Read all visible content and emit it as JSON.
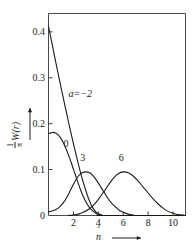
{
  "chart_data": {
    "type": "line",
    "title": "",
    "xlabel": "n̂",
    "ylabel": "(1/π) W(r)",
    "xlim": [
      0,
      11
    ],
    "ylim": [
      0,
      0.44
    ],
    "grid": false,
    "legend_position": "inline-annotations",
    "x_ticks": [
      2,
      4,
      6,
      8,
      10
    ],
    "x_tick_labels": [
      "2",
      "4",
      "6",
      "8",
      "10"
    ],
    "y_ticks": [
      0,
      0.1,
      0.2,
      0.3,
      0.4
    ],
    "y_tick_labels": [
      "0",
      "0.1",
      "0.2",
      "0.3",
      "0.4"
    ],
    "annotations": [
      {
        "text": "a=−2",
        "x": 1.6,
        "y": 0.265
      },
      {
        "text": "0",
        "x": 1.2,
        "y": 0.155
      },
      {
        "text": "3",
        "x": 2.55,
        "y": 0.125
      },
      {
        "text": "6",
        "x": 5.65,
        "y": 0.125
      }
    ],
    "series": [
      {
        "name": "a=-2",
        "label": "a=−2",
        "color": "#1b1b1b",
        "points": [
          [
            0.0,
            0.412
          ],
          [
            0.15,
            0.392
          ],
          [
            0.3,
            0.372
          ],
          [
            0.5,
            0.345
          ],
          [
            0.75,
            0.312
          ],
          [
            1.0,
            0.28
          ],
          [
            1.25,
            0.248
          ],
          [
            1.5,
            0.217
          ],
          [
            1.75,
            0.186
          ],
          [
            2.0,
            0.157
          ],
          [
            2.25,
            0.128
          ],
          [
            2.5,
            0.101
          ],
          [
            2.75,
            0.076
          ],
          [
            3.0,
            0.054
          ],
          [
            3.2,
            0.038
          ],
          [
            3.4,
            0.025
          ],
          [
            3.6,
            0.015
          ],
          [
            3.8,
            0.008
          ],
          [
            4.0,
            0.004
          ],
          [
            4.2,
            0.001
          ],
          [
            4.4,
            0.0
          ],
          [
            11.0,
            0.0
          ]
        ]
      },
      {
        "name": "a=0",
        "label": "0",
        "color": "#1b1b1b",
        "points": [
          [
            0.0,
            0.178
          ],
          [
            0.2,
            0.18
          ],
          [
            0.4,
            0.181
          ],
          [
            0.6,
            0.179
          ],
          [
            0.8,
            0.175
          ],
          [
            1.0,
            0.168
          ],
          [
            1.2,
            0.158
          ],
          [
            1.4,
            0.146
          ],
          [
            1.6,
            0.132
          ],
          [
            1.8,
            0.117
          ],
          [
            2.0,
            0.101
          ],
          [
            2.2,
            0.085
          ],
          [
            2.4,
            0.069
          ],
          [
            2.6,
            0.054
          ],
          [
            2.8,
            0.041
          ],
          [
            3.0,
            0.03
          ],
          [
            3.2,
            0.021
          ],
          [
            3.4,
            0.014
          ],
          [
            3.6,
            0.009
          ],
          [
            3.8,
            0.005
          ],
          [
            4.0,
            0.003
          ],
          [
            4.3,
            0.001
          ],
          [
            4.6,
            0.0
          ],
          [
            11.0,
            0.0
          ]
        ]
      },
      {
        "name": "a=3",
        "label": "3",
        "color": "#1b1b1b",
        "points": [
          [
            0.0,
            0.008
          ],
          [
            0.3,
            0.01
          ],
          [
            0.6,
            0.013
          ],
          [
            0.9,
            0.019
          ],
          [
            1.2,
            0.028
          ],
          [
            1.5,
            0.041
          ],
          [
            1.8,
            0.057
          ],
          [
            2.1,
            0.073
          ],
          [
            2.4,
            0.086
          ],
          [
            2.7,
            0.093
          ],
          [
            3.0,
            0.095
          ],
          [
            3.3,
            0.093
          ],
          [
            3.6,
            0.086
          ],
          [
            3.9,
            0.075
          ],
          [
            4.2,
            0.062
          ],
          [
            4.5,
            0.049
          ],
          [
            4.8,
            0.036
          ],
          [
            5.1,
            0.026
          ],
          [
            5.4,
            0.018
          ],
          [
            5.7,
            0.011
          ],
          [
            6.0,
            0.007
          ],
          [
            6.4,
            0.003
          ],
          [
            6.8,
            0.001
          ],
          [
            7.2,
            0.0
          ],
          [
            11.0,
            0.0
          ]
        ]
      },
      {
        "name": "a=6",
        "label": "6",
        "color": "#1b1b1b",
        "points": [
          [
            1.6,
            0.0
          ],
          [
            2.0,
            0.001
          ],
          [
            2.4,
            0.003
          ],
          [
            2.8,
            0.007
          ],
          [
            3.2,
            0.013
          ],
          [
            3.6,
            0.022
          ],
          [
            4.0,
            0.035
          ],
          [
            4.4,
            0.05
          ],
          [
            4.8,
            0.066
          ],
          [
            5.2,
            0.081
          ],
          [
            5.6,
            0.091
          ],
          [
            6.0,
            0.095
          ],
          [
            6.4,
            0.093
          ],
          [
            6.8,
            0.086
          ],
          [
            7.2,
            0.075
          ],
          [
            7.6,
            0.062
          ],
          [
            8.0,
            0.049
          ],
          [
            8.4,
            0.036
          ],
          [
            8.8,
            0.025
          ],
          [
            9.2,
            0.016
          ],
          [
            9.6,
            0.009
          ],
          [
            10.0,
            0.005
          ],
          [
            10.4,
            0.002
          ],
          [
            10.8,
            0.001
          ],
          [
            11.0,
            0.0
          ]
        ]
      }
    ]
  },
  "axes": {
    "y_arrow": "up-arrow",
    "x_arrow": "right-arrow"
  }
}
